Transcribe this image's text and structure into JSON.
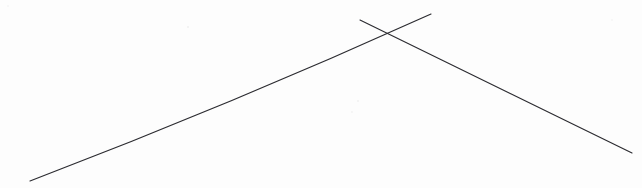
{
  "document": {
    "kind": "scanned-line-drawing",
    "width": 642,
    "height": 188,
    "background_color": "#fdfdfd",
    "page_tint": "#ffffff",
    "description": "Two thin hand-drawn dark lines crossing to form a narrow X near the upper right of a white page"
  },
  "ink": {
    "stroke_color": "#2b2b30",
    "stroke_color_light": "#52525a",
    "stroke_width": 1.15,
    "stroke_width_heavy": 1.6
  },
  "strokes": [
    {
      "id": "line-ascending",
      "name": "ascending-line",
      "label": "Long ascending line",
      "start": {
        "x": 30,
        "y": 181
      },
      "end": {
        "x": 431,
        "y": 14
      },
      "control": {
        "x": 232,
        "y": 104
      },
      "curvature": "slight-bow",
      "color": "#2b2b30",
      "width": 1.15,
      "direction": "bottom-left-to-top-right"
    },
    {
      "id": "line-descending",
      "name": "descending-line",
      "label": "Descending line",
      "start": {
        "x": 360,
        "y": 20
      },
      "end": {
        "x": 632,
        "y": 153
      },
      "control": {
        "x": 500,
        "y": 88
      },
      "curvature": "slight-bow",
      "color": "#2b2b30",
      "width": 1.15,
      "direction": "top-left-to-bottom-right"
    }
  ],
  "intersection": {
    "name": "crossing-point",
    "x": 379,
    "y": 33,
    "label": "X crossing"
  },
  "specks": [
    {
      "x": 188,
      "y": 27,
      "r": 1.2,
      "color": "#efefef"
    },
    {
      "x": 358,
      "y": 101,
      "r": 1.1,
      "color": "#f0f0f0"
    },
    {
      "x": 352,
      "y": 112,
      "r": 0.9,
      "color": "#f3f3f3"
    },
    {
      "x": 8,
      "y": 6,
      "r": 1.0,
      "color": "#f4f4f4"
    },
    {
      "x": 612,
      "y": 20,
      "r": 0.9,
      "color": "#f5f5f5"
    }
  ]
}
